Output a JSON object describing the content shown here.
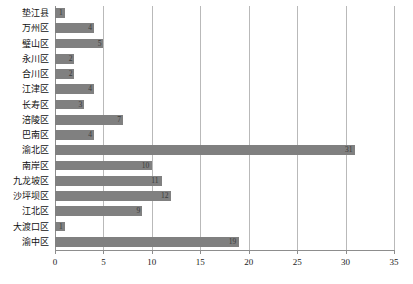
{
  "chart_data": {
    "type": "bar",
    "orientation": "horizontal",
    "title": "",
    "xlabel": "",
    "ylabel": "",
    "xlim": [
      0,
      35
    ],
    "xticks": [
      0,
      5,
      10,
      15,
      20,
      25,
      30,
      35
    ],
    "grid": "vertical",
    "legend": "none",
    "bar_color": "#808080",
    "gridline_color": "#b9b9b9",
    "axis_color": "#8d8d8d",
    "categories": [
      "垫江县",
      "万州区",
      "璧山区",
      "永川区",
      "合川区",
      "江津区",
      "长寿区",
      "涪陵区",
      "巴南区",
      "渝北区",
      "南岸区",
      "九龙坡区",
      "沙坪坝区",
      "江北区",
      "大渡口区",
      "渝中区"
    ],
    "values": [
      1,
      4,
      5,
      2,
      2,
      4,
      3,
      7,
      4,
      31,
      10,
      11,
      12,
      9,
      1,
      19
    ],
    "data_labels": [
      "1",
      "4",
      "5",
      "2",
      "2",
      "4",
      "3",
      "7",
      "4",
      "31",
      "10",
      "11",
      "12",
      "9",
      "1",
      "19"
    ]
  }
}
